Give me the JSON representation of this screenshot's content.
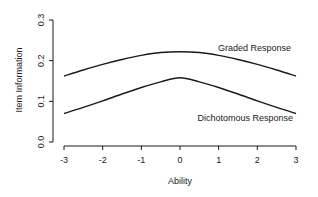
{
  "chart_data": {
    "type": "line",
    "title": "",
    "xlabel": "Ability",
    "ylabel": "Item Information",
    "xlim": [
      -3,
      3
    ],
    "ylim": [
      0,
      0.3
    ],
    "xticks": [
      "-3",
      "-2",
      "-1",
      "0",
      "1",
      "2",
      "3"
    ],
    "yticks": [
      "0.0",
      "0.1",
      "0.2",
      "0.3"
    ],
    "grid": false,
    "legend": "inline labels",
    "x": [
      -3,
      -2.5,
      -2,
      -1.5,
      -1,
      -0.5,
      0,
      0.5,
      1,
      1.5,
      2,
      2.5,
      3
    ],
    "series": [
      {
        "name": "Graded Response",
        "values": [
          0.162,
          0.177,
          0.191,
          0.203,
          0.213,
          0.22,
          0.222,
          0.22,
          0.213,
          0.203,
          0.191,
          0.177,
          0.162
        ]
      },
      {
        "name": "Dichotomous Response",
        "values": [
          0.07,
          0.085,
          0.101,
          0.118,
          0.134,
          0.148,
          0.158,
          0.148,
          0.134,
          0.118,
          0.101,
          0.085,
          0.07
        ]
      }
    ],
    "annotations": [
      {
        "text": "Graded Response",
        "near": "upper curve, right"
      },
      {
        "text": "Dichotomous Response",
        "near": "lower curve, right, below"
      }
    ]
  },
  "colors": {
    "line": "#1a1a1a",
    "background": "#ffffff"
  }
}
